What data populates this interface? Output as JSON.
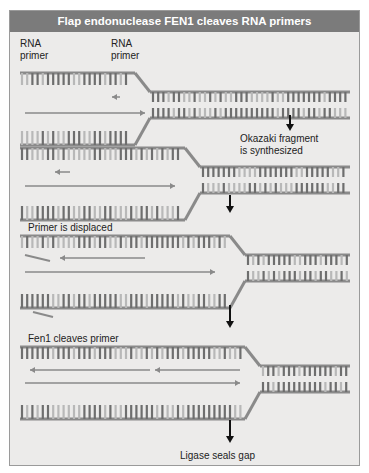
{
  "title": "Flap endonuclease FEN1 cleaves RNA primers",
  "labels": {
    "rna_primer_1": "RNA\nprimer",
    "rna_primer_2": "RNA\nprimer",
    "step1": "Okazaki fragment\nis synthesized",
    "step2": "Primer is displaced",
    "step3": "Fen1 cleaves primer",
    "step4": "Ligase seals gap"
  },
  "colors": {
    "panel_bg": "#ecebea",
    "header_bg": "#7b7b7b",
    "backbone": "#8a8a8a",
    "base_dark": "#6e6e6e",
    "base_light": "#b8b8b8"
  }
}
